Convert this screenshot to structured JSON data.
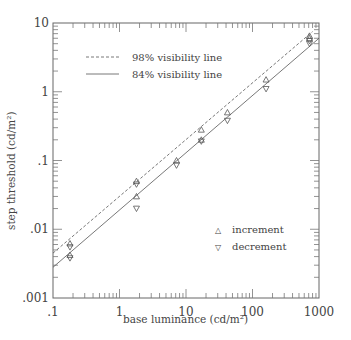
{
  "chart_data": {
    "type": "scatter",
    "title": "",
    "xlabel": "base luminance (cd/m²)",
    "ylabel": "step threshold (cd/m²)",
    "xscale": "log",
    "yscale": "log",
    "xlim": [
      0.1,
      1000
    ],
    "ylim": [
      0.001,
      10
    ],
    "x_ticks": [
      ".1",
      "1",
      "10",
      "100",
      "1000"
    ],
    "y_ticks": [
      ".001",
      ".01",
      ".1",
      "1",
      "10"
    ],
    "grid": false,
    "legend_top": [
      {
        "label": "98% visibility line",
        "style": "dashed"
      },
      {
        "label": "84% visibility line",
        "style": "solid"
      }
    ],
    "legend_bottom": [
      {
        "label": "increment",
        "marker": "triangle-up"
      },
      {
        "label": "decrement",
        "marker": "triangle-down"
      }
    ],
    "lines": [
      {
        "name": "98% visibility line",
        "style": "dashed",
        "x": [
          0.1,
          800
        ],
        "y": [
          0.0045,
          7.5
        ]
      },
      {
        "name": "84% visibility line",
        "style": "solid",
        "x": [
          0.1,
          1000
        ],
        "y": [
          0.0028,
          6.0
        ]
      }
    ],
    "series": [
      {
        "name": "increment",
        "marker": "triangle-up",
        "x": [
          0.18,
          0.18,
          1.8,
          1.8,
          7.2,
          17,
          17,
          42,
          160,
          720,
          720
        ],
        "y": [
          0.0062,
          0.0042,
          0.05,
          0.03,
          0.1,
          0.28,
          0.2,
          0.5,
          1.5,
          6.5,
          6.0
        ]
      },
      {
        "name": "decrement",
        "marker": "triangle-down",
        "x": [
          0.18,
          0.18,
          1.8,
          1.8,
          7.2,
          17,
          42,
          160,
          720,
          720
        ],
        "y": [
          0.0055,
          0.0038,
          0.045,
          0.02,
          0.085,
          0.19,
          0.38,
          1.1,
          5.5,
          5.0
        ]
      }
    ]
  },
  "axes": {
    "x_ticks": [
      ".1",
      "1",
      "10",
      "100",
      "1000"
    ],
    "y_ticks": [
      ".001",
      ".01",
      ".1",
      "1",
      "10"
    ],
    "xlabel": "base luminance (cd/m²)",
    "ylabel": "step threshold (cd/m²)"
  },
  "legend": {
    "dashed_label": "98% visibility line",
    "solid_label": "84% visibility line",
    "increment_label": "increment",
    "decrement_label": "decrement",
    "increment_symbol": "△",
    "decrement_symbol": "▽"
  }
}
